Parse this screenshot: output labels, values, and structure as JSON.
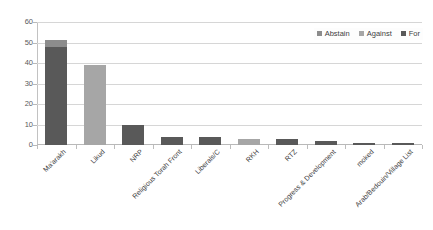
{
  "chart_data": {
    "type": "bar",
    "title": "",
    "subtitle": "",
    "xlabel": "",
    "ylabel": "",
    "ylim": [
      0,
      60
    ],
    "yticks": [
      0,
      10,
      20,
      30,
      40,
      50,
      60
    ],
    "ytick_labels": [
      "0",
      "10",
      "20",
      "30",
      "40",
      "50",
      "60"
    ],
    "grid": true,
    "legend_position": "top-right",
    "categories": [
      "Ma'arakh",
      "Likud",
      "NRP",
      "Religious Torah Front",
      "Liberals/C",
      "RKH",
      "RTZ",
      "Progress & Development",
      "moked",
      "Arab/Bedouin/Village List"
    ],
    "series": [
      {
        "name": "For",
        "color": "#595959",
        "values": [
          48,
          0,
          10,
          4,
          4,
          0,
          3,
          2,
          1,
          1
        ]
      },
      {
        "name": "Against",
        "color": "#a6a6a6",
        "values": [
          0,
          39,
          0,
          0,
          0,
          3,
          0,
          0,
          0,
          0
        ]
      },
      {
        "name": "Abstain",
        "color": "#8c8c8c",
        "values": [
          3,
          0,
          0,
          0,
          0,
          0,
          0,
          0,
          0,
          0
        ]
      }
    ]
  },
  "legend": {
    "items": [
      {
        "label": "Abstain",
        "color": "#8c8c8c"
      },
      {
        "label": "Against",
        "color": "#a6a6a6"
      },
      {
        "label": "For",
        "color": "#595959"
      }
    ]
  },
  "axes": {
    "y_tick_labels": [
      "0",
      "10",
      "20",
      "30",
      "40",
      "50",
      "60"
    ],
    "x_tick_labels": [
      "Ma'arakh",
      "Likud",
      "NRP",
      "Religious Torah Front",
      "Liberals/C",
      "RKH",
      "RTZ",
      "Progress & Development",
      "moked",
      "Arab/Bedouin/Village List"
    ]
  }
}
